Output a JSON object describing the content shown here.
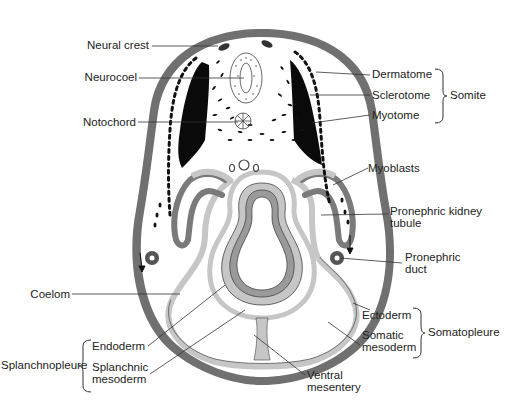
{
  "figure": {
    "colors": {
      "ectoderm": "#6e6e6e",
      "mesoderm_light": "#c6c6c6",
      "mesoderm_dark": "#7a7a7a",
      "myotome_black": "#0a0a0a",
      "background": "#ffffff",
      "line": "#333333"
    }
  },
  "labels": {
    "neural_crest": "Neural crest",
    "neurocoel": "Neurocoel",
    "notochord": "Notochord",
    "dermatome": "Dermatome",
    "sclerotome": "Sclerotome",
    "myotome": "Myotome",
    "somite": "Somite",
    "myoblasts": "Myoblasts",
    "pronephric_kidney_tubule_1": "Pronephric kidney",
    "pronephric_kidney_tubule_2": "tubule",
    "pronephric_duct_1": "Pronephric",
    "pronephric_duct_2": "duct",
    "coelom": "Coelom",
    "ectoderm": "Ectoderm",
    "somatic_mesoderm_1": "Somatic",
    "somatic_mesoderm_2": "mesoderm",
    "somatopleure": "Somatopleure",
    "endoderm": "Endoderm",
    "splanchnic_mesoderm_1": "Splanchnic",
    "splanchnic_mesoderm_2": "mesoderm",
    "splanchnopleure": "Splanchnopleure",
    "ventral_mesentery_1": "Ventral",
    "ventral_mesentery_2": "mesentery"
  },
  "groups": [
    {
      "name": "Somite",
      "members": [
        "Dermatome",
        "Sclerotome",
        "Myotome"
      ]
    },
    {
      "name": "Somatopleure",
      "members": [
        "Ectoderm",
        "Somatic mesoderm"
      ]
    },
    {
      "name": "Splanchnopleure",
      "members": [
        "Endoderm",
        "Splanchnic mesoderm"
      ]
    }
  ]
}
